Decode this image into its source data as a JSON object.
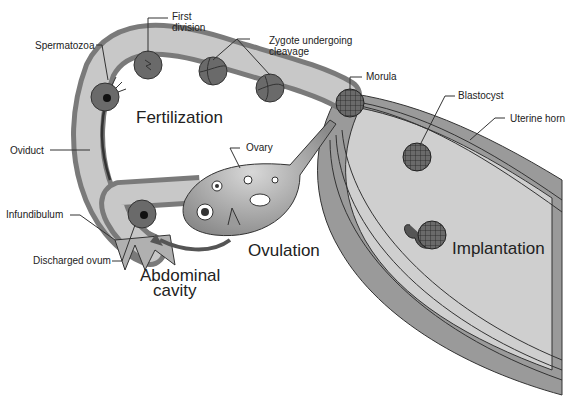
{
  "diagram": {
    "colors": {
      "wall": "#7a7a7a",
      "lumen": "#c8c8c8",
      "muscle": "#9a9a9a",
      "cell": "#6a6a6a",
      "outline": "#333333",
      "background": "#ffffff"
    },
    "labels": {
      "spermatozoa": "Spermatozoa",
      "first_division_1": "First",
      "first_division_2": "division",
      "zygote_1": "Zygote undergoing",
      "zygote_2": "cleavage",
      "morula": "Morula",
      "blastocyst": "Blastocyst",
      "uterine_horn": "Uterine horn",
      "oviduct": "Oviduct",
      "ovary": "Ovary",
      "infundibulum": "Infundibulum",
      "discharged_ovum": "Discharged ovum"
    },
    "regions": {
      "fertilization": "Fertilization",
      "ovulation": "Ovulation",
      "abdominal_1": "Abdominal",
      "abdominal_2": "cavity",
      "implantation": "Implantation"
    }
  }
}
